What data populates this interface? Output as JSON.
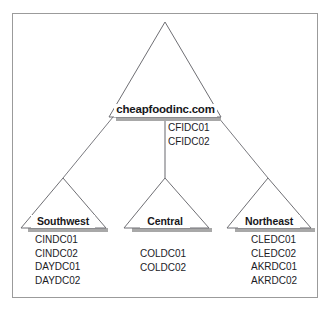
{
  "diagram": {
    "type": "hierarchy-tree",
    "title": "",
    "colors": {
      "frame_border": "#9b9b9b",
      "triangle_stroke": "#6f6f74",
      "shadow": "#a8a8a8",
      "connector": "#7a7a7f",
      "text": "#17171a",
      "background": "#ffffff"
    },
    "root": {
      "label": "cheapfoodinc.com",
      "servers": [
        "CFIDC01",
        "CFIDC02"
      ]
    },
    "children": [
      {
        "label": "Southwest",
        "servers": [
          "CINDC01",
          "CINDC02",
          "DAYDC01",
          "DAYDC02"
        ]
      },
      {
        "label": "Central",
        "servers": [
          "COLDC01",
          "COLDC02"
        ]
      },
      {
        "label": "Northeast",
        "servers": [
          "CLEDC01",
          "CLEDC02",
          "AKRDC01",
          "AKRDC02"
        ]
      }
    ]
  }
}
